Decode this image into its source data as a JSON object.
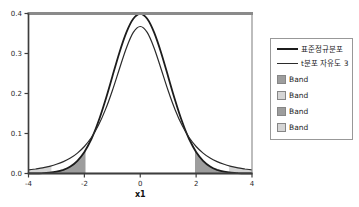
{
  "chart_data": {
    "type": "line",
    "title": "",
    "xlabel": "x1",
    "ylabel": "",
    "xlim": [
      -4,
      4
    ],
    "ylim": [
      0,
      0.4
    ],
    "grid": false,
    "legend_position": "right-outside",
    "xticks": [
      {
        "v": -4,
        "label": "-4"
      },
      {
        "v": -2,
        "label": "-2"
      },
      {
        "v": 0,
        "label": "0"
      },
      {
        "v": 2,
        "label": "2"
      },
      {
        "v": 4,
        "label": "4"
      }
    ],
    "yticks": [
      {
        "v": 0.0,
        "label": "0.0"
      },
      {
        "v": 0.1,
        "label": "0.1"
      },
      {
        "v": 0.2,
        "label": "0.2"
      },
      {
        "v": 0.3,
        "label": "0.3"
      },
      {
        "v": 0.4,
        "label": "0.4"
      }
    ],
    "x": [
      -4,
      -3.75,
      -3.5,
      -3.25,
      -3,
      -2.75,
      -2.5,
      -2.25,
      -2,
      -1.75,
      -1.5,
      -1.25,
      -1,
      -0.75,
      -0.5,
      -0.25,
      0,
      0.25,
      0.5,
      0.75,
      1,
      1.25,
      1.5,
      1.75,
      2,
      2.25,
      2.5,
      2.75,
      3,
      3.25,
      3.5,
      3.75,
      4
    ],
    "series": [
      {
        "name": "표준정규분포",
        "color": "#1c1c1c",
        "width": 1.8,
        "values": [
          0.00013,
          0.00035,
          0.00087,
          0.00203,
          0.00443,
          0.00909,
          0.01753,
          0.03174,
          0.05399,
          0.08628,
          0.12952,
          0.18265,
          0.24197,
          0.30114,
          0.35207,
          0.38667,
          0.39894,
          0.38667,
          0.35207,
          0.30114,
          0.24197,
          0.18265,
          0.12952,
          0.08628,
          0.05399,
          0.03174,
          0.01753,
          0.00909,
          0.00443,
          0.00203,
          0.00087,
          0.00035,
          0.00013
        ]
      },
      {
        "name": "t분포 자유도 3",
        "color": "#2b2b2b",
        "width": 1.2,
        "values": [
          0.00916,
          0.01136,
          0.01422,
          0.01798,
          0.02297,
          0.02965,
          0.03866,
          0.05089,
          0.06751,
          0.09001,
          0.12002,
          0.15891,
          0.20675,
          0.26064,
          0.31318,
          0.3527,
          0.36755,
          0.3527,
          0.31318,
          0.26064,
          0.20675,
          0.15891,
          0.12002,
          0.09001,
          0.06751,
          0.05089,
          0.03866,
          0.02965,
          0.02297,
          0.01798,
          0.01422,
          0.01136,
          0.00916
        ]
      }
    ],
    "bands": [
      {
        "label": "Band",
        "series": 0,
        "from": -4,
        "to": -1.96,
        "color": "#9d9d9d"
      },
      {
        "label": "Band",
        "series": 1,
        "from": -4,
        "to": -3.182,
        "color": "#d5d5d5"
      },
      {
        "label": "Band",
        "series": 0,
        "from": 1.96,
        "to": 4,
        "color": "#9d9d9d"
      },
      {
        "label": "Band",
        "series": 1,
        "from": 3.182,
        "to": 4,
        "color": "#d5d5d5"
      }
    ]
  },
  "legend": {
    "entries": [
      {
        "type": "line",
        "label": "표준정규분포"
      },
      {
        "type": "line",
        "label": "t분포 자유도 3"
      },
      {
        "type": "band",
        "label": "Band",
        "color": "#9d9d9d"
      },
      {
        "type": "band",
        "label": "Band",
        "color": "#d5d5d5"
      },
      {
        "type": "band",
        "label": "Band",
        "color": "#9d9d9d"
      },
      {
        "type": "band",
        "label": "Band",
        "color": "#d5d5d5"
      }
    ]
  },
  "colors": {
    "frame": "#919191",
    "frame_top": "#8a8a8a",
    "axis": "#3d3d3d",
    "text": "#2a2a2a",
    "background": "#ffffff"
  }
}
